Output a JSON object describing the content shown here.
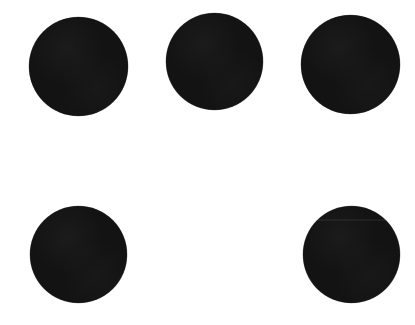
{
  "canvas": {
    "width": 415,
    "height": 325,
    "background_color": "#ffffff",
    "description": "Five solid black circles arranged in a 3-column by 2-row grid on a plain white background; the bottom-middle grid position is empty."
  },
  "style": {
    "dot_color": "#131313",
    "background_color": "#ffffff",
    "edge": "soft anti-aliased",
    "texture": "subtle scanned ink grain"
  },
  "grid": {
    "columns": 3,
    "rows": 2,
    "filled_count": 5,
    "empty_count": 1,
    "empty_positions": [
      "row-2-col-2"
    ]
  },
  "dots": [
    {
      "id": "dot-top-left",
      "label": "Top left dot",
      "row": 1,
      "column": 1,
      "center_x": 78,
      "center_y": 66,
      "diameter": 99,
      "color": "#131313",
      "seam": false
    },
    {
      "id": "dot-top-center",
      "label": "Top center dot",
      "row": 1,
      "column": 2,
      "center_x": 214,
      "center_y": 61,
      "diameter": 97,
      "color": "#131313",
      "seam": false
    },
    {
      "id": "dot-top-right",
      "label": "Top right dot",
      "row": 1,
      "column": 3,
      "center_x": 350,
      "center_y": 64,
      "diameter": 99,
      "color": "#131313",
      "seam": false
    },
    {
      "id": "dot-bottom-left",
      "label": "Bottom left dot",
      "row": 2,
      "column": 1,
      "center_x": 78,
      "center_y": 254,
      "diameter": 97,
      "color": "#131313",
      "seam": false
    },
    {
      "id": "dot-bottom-right",
      "label": "Bottom right dot",
      "row": 2,
      "column": 3,
      "center_x": 351,
      "center_y": 254,
      "diameter": 97,
      "color": "#131313",
      "seam": true
    }
  ],
  "empty_slot": {
    "id": "slot-bottom-center",
    "label": "Bottom center empty slot",
    "row": 2,
    "column": 2,
    "center_x": 214,
    "center_y": 254,
    "diameter": 97
  }
}
